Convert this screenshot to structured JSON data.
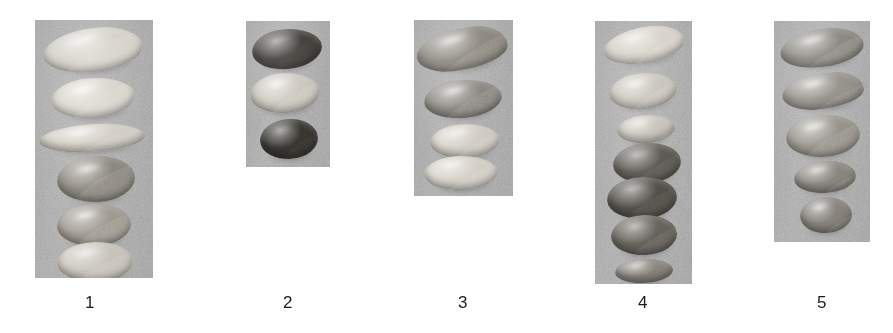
{
  "figure": {
    "name": "seed-comparison-plate",
    "background_color": "#ffffff",
    "panel_background_color": "#a9a9a9",
    "caption_color": "#1b1b1b",
    "panel_count": 5,
    "total_seed_count": 25
  },
  "panels": [
    {
      "id": "panel-1",
      "label": "1",
      "x": 35,
      "y": 20,
      "width": 118,
      "height": 258,
      "label_x": 90,
      "seed_count": 6,
      "seeds": [
        {
          "name": "seed-1-1",
          "shape": "lens-elongated",
          "tone": "light",
          "color": "#d8d4cb",
          "x": 8,
          "y": 8,
          "w": 100,
          "h": 44,
          "rot": -6
        },
        {
          "name": "seed-1-2",
          "shape": "ovate",
          "tone": "light",
          "color": "#dcd8cf",
          "x": 16,
          "y": 58,
          "w": 84,
          "h": 40,
          "rot": -5
        },
        {
          "name": "seed-1-3",
          "shape": "lens-elongated",
          "tone": "light",
          "color": "#d6d2c8",
          "x": 4,
          "y": 104,
          "w": 106,
          "h": 28,
          "rot": -3
        },
        {
          "name": "seed-1-4",
          "shape": "broad-oval",
          "tone": "mid",
          "color": "#8e8a82",
          "x": 22,
          "y": 136,
          "w": 78,
          "h": 46,
          "rot": -3
        },
        {
          "name": "seed-1-5",
          "shape": "broad-oval",
          "tone": "mid",
          "color": "#a5a096",
          "x": 22,
          "y": 184,
          "w": 74,
          "h": 42,
          "rot": -2
        },
        {
          "name": "seed-1-6",
          "shape": "broad-oval",
          "tone": "light",
          "color": "#cfcbc2",
          "x": 22,
          "y": 222,
          "w": 76,
          "h": 40,
          "rot": -2
        }
      ]
    },
    {
      "id": "panel-2",
      "label": "2",
      "x": 246,
      "y": 21,
      "width": 84,
      "height": 146,
      "label_x": 288,
      "seed_count": 3,
      "seeds": [
        {
          "name": "seed-2-1",
          "shape": "ovate",
          "tone": "dark",
          "color": "#3b3934",
          "x": 6,
          "y": 8,
          "w": 70,
          "h": 40,
          "rot": -6
        },
        {
          "name": "seed-2-2",
          "shape": "ovate",
          "tone": "light",
          "color": "#cfcbc1",
          "x": 4,
          "y": 52,
          "w": 70,
          "h": 40,
          "rot": -4
        },
        {
          "name": "seed-2-3",
          "shape": "broad-oval",
          "tone": "dark",
          "color": "#3a3833",
          "x": 14,
          "y": 98,
          "w": 58,
          "h": 40,
          "rot": -4
        }
      ]
    },
    {
      "id": "panel-3",
      "label": "3",
      "x": 414,
      "y": 20,
      "width": 99,
      "height": 176,
      "label_x": 463,
      "seed_count": 4,
      "seeds": [
        {
          "name": "seed-3-1",
          "shape": "lens-pointed",
          "tone": "mid",
          "color": "#8b877e",
          "x": 2,
          "y": 8,
          "w": 92,
          "h": 42,
          "rot": -8
        },
        {
          "name": "seed-3-2",
          "shape": "ovate",
          "tone": "mid",
          "color": "#8a8680",
          "x": 10,
          "y": 60,
          "w": 78,
          "h": 38,
          "rot": -5
        },
        {
          "name": "seed-3-3",
          "shape": "ovate",
          "tone": "light",
          "color": "#d7d3ca",
          "x": 16,
          "y": 104,
          "w": 70,
          "h": 34,
          "rot": -3
        },
        {
          "name": "seed-3-4",
          "shape": "ovate",
          "tone": "light",
          "color": "#dbd7ce",
          "x": 10,
          "y": 136,
          "w": 74,
          "h": 34,
          "rot": -2
        }
      ]
    },
    {
      "id": "panel-4",
      "label": "4",
      "x": 595,
      "y": 21,
      "width": 97,
      "height": 263,
      "label_x": 643,
      "seed_count": 7,
      "seeds": [
        {
          "name": "seed-4-1",
          "shape": "lens-elongated",
          "tone": "light",
          "color": "#d9d5cb",
          "x": 8,
          "y": 6,
          "w": 82,
          "h": 36,
          "rot": -9
        },
        {
          "name": "seed-4-2",
          "shape": "ovate",
          "tone": "light",
          "color": "#cbc7be",
          "x": 14,
          "y": 52,
          "w": 68,
          "h": 36,
          "rot": -6
        },
        {
          "name": "seed-4-3",
          "shape": "small-oval",
          "tone": "light",
          "color": "#cac6bd",
          "x": 22,
          "y": 94,
          "w": 58,
          "h": 28,
          "rot": -4
        },
        {
          "name": "seed-4-4",
          "shape": "broad-oval",
          "tone": "dark",
          "color": "#5d5a54",
          "x": 18,
          "y": 122,
          "w": 68,
          "h": 40,
          "rot": -4
        },
        {
          "name": "seed-4-5",
          "shape": "broad-oval",
          "tone": "dark",
          "color": "#55524c",
          "x": 12,
          "y": 156,
          "w": 70,
          "h": 42,
          "rot": -3
        },
        {
          "name": "seed-4-6",
          "shape": "broad-oval",
          "tone": "dark",
          "color": "#6a6660",
          "x": 16,
          "y": 194,
          "w": 66,
          "h": 40,
          "rot": -3
        },
        {
          "name": "seed-4-7",
          "shape": "small-oval",
          "tone": "mid",
          "color": "#8d8982",
          "x": 20,
          "y": 238,
          "w": 58,
          "h": 24,
          "rot": -3
        }
      ]
    },
    {
      "id": "panel-5",
      "label": "5",
      "x": 774,
      "y": 21,
      "width": 96,
      "height": 221,
      "label_x": 822,
      "seed_count": 5,
      "seeds": [
        {
          "name": "seed-5-1",
          "shape": "lens-elongated",
          "tone": "mid",
          "color": "#8a8780",
          "x": 6,
          "y": 8,
          "w": 84,
          "h": 38,
          "rot": -7
        },
        {
          "name": "seed-5-2",
          "shape": "lens-pointed",
          "tone": "mid",
          "color": "#949189",
          "x": 8,
          "y": 52,
          "w": 82,
          "h": 36,
          "rot": -5
        },
        {
          "name": "seed-5-3",
          "shape": "broad-oval",
          "tone": "mid",
          "color": "#99958d",
          "x": 12,
          "y": 94,
          "w": 74,
          "h": 42,
          "rot": -4
        },
        {
          "name": "seed-5-4",
          "shape": "small-oval",
          "tone": "mid",
          "color": "#8f8b84",
          "x": 20,
          "y": 140,
          "w": 62,
          "h": 32,
          "rot": -4
        },
        {
          "name": "seed-5-5",
          "shape": "small-oval",
          "tone": "mid",
          "color": "#8c8881",
          "x": 26,
          "y": 176,
          "w": 52,
          "h": 36,
          "rot": -3
        }
      ]
    }
  ]
}
